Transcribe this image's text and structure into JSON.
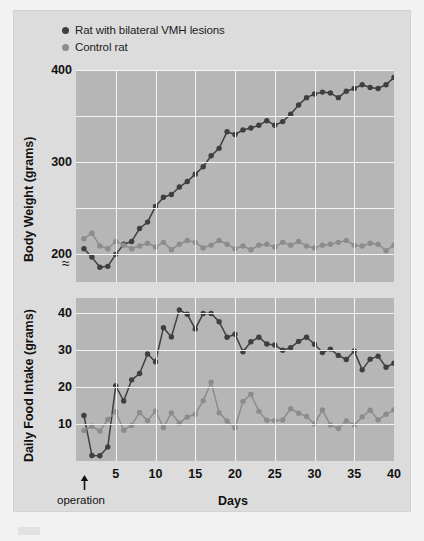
{
  "legend": {
    "items": [
      {
        "label": "Rat with bilateral VMH lesions",
        "color": "#3f3f3f"
      },
      {
        "label": "Control rat",
        "color": "#8c8c8c"
      }
    ]
  },
  "annotations": {
    "operation_label": "operation",
    "axis_break_symbol": "≈"
  },
  "colors": {
    "lesion": "#3f3f3f",
    "control": "#8c8c8c",
    "plot_background": "#b6b6b6",
    "panel_background": "#dcdcdc",
    "page_background": "#f2f2f2",
    "gridline": "#f4f4f4"
  },
  "chart_data": [
    {
      "type": "line",
      "title": "",
      "xlabel": "Days",
      "ylabel": "Body Weight (grams)",
      "xlim": [
        0,
        40
      ],
      "ylim": [
        170,
        400
      ],
      "xticks": [
        5,
        10,
        15,
        20,
        25,
        30,
        35,
        40
      ],
      "yticks": [
        200,
        300,
        400
      ],
      "gridlines_y": [
        200,
        250,
        300,
        350,
        400
      ],
      "gridlines_x": [
        5,
        10,
        15,
        20,
        25,
        30,
        35,
        40
      ],
      "grid": true,
      "legend_position": "above-plot",
      "axis_break": true,
      "x": [
        1,
        2,
        3,
        4,
        5,
        6,
        7,
        8,
        9,
        10,
        11,
        12,
        13,
        14,
        15,
        16,
        17,
        18,
        19,
        20,
        21,
        22,
        23,
        24,
        25,
        26,
        27,
        28,
        29,
        30,
        31,
        32,
        33,
        34,
        35,
        36,
        37,
        38,
        39,
        40
      ],
      "series": [
        {
          "name": "Rat with bilateral VMH lesions",
          "color": "#3f3f3f",
          "values": [
            206,
            197,
            186,
            187,
            200,
            211,
            214,
            228,
            235,
            252,
            262,
            265,
            273,
            279,
            287,
            295,
            307,
            315,
            333,
            330,
            335,
            337,
            340,
            345,
            340,
            344,
            352,
            362,
            370,
            374,
            376,
            375,
            370,
            377,
            380,
            384,
            381,
            380,
            384,
            392
          ]
        },
        {
          "name": "Control rat",
          "color": "#8c8c8c",
          "values": [
            217,
            223,
            209,
            206,
            214,
            210,
            206,
            209,
            212,
            208,
            213,
            205,
            211,
            215,
            213,
            207,
            210,
            215,
            211,
            206,
            209,
            205,
            210,
            211,
            208,
            213,
            210,
            214,
            209,
            207,
            210,
            211,
            213,
            215,
            210,
            209,
            212,
            211,
            204,
            210
          ]
        }
      ]
    },
    {
      "type": "line",
      "title": "",
      "xlabel": "Days",
      "ylabel": "Daily Food Intake (grams)",
      "xlim": [
        0,
        40
      ],
      "ylim": [
        0,
        44
      ],
      "xticks": [
        5,
        10,
        15,
        20,
        25,
        30,
        35,
        40
      ],
      "yticks": [
        10,
        20,
        30,
        40
      ],
      "gridlines_y": [
        10,
        20,
        30,
        40
      ],
      "gridlines_x": [
        5,
        10,
        15,
        20,
        25,
        30,
        35,
        40
      ],
      "grid": true,
      "x": [
        1,
        2,
        3,
        4,
        5,
        6,
        7,
        8,
        9,
        10,
        11,
        12,
        13,
        14,
        15,
        16,
        17,
        18,
        19,
        20,
        21,
        22,
        23,
        24,
        25,
        26,
        27,
        28,
        29,
        30,
        31,
        32,
        33,
        34,
        35,
        36,
        37,
        38,
        39,
        40
      ],
      "series": [
        {
          "name": "Rat with bilateral VMH lesions",
          "color": "#3f3f3f",
          "values": [
            12.3,
            1.5,
            1.4,
            3.8,
            20.3,
            16.2,
            21.9,
            23.6,
            28.9,
            26.8,
            36.0,
            33.5,
            40.8,
            39.6,
            35.6,
            39.8,
            39.8,
            37.6,
            33.4,
            34.2,
            29.5,
            32.2,
            33.4,
            31.6,
            31.3,
            29.9,
            30.6,
            32.3,
            33.4,
            31.5,
            29.3,
            30.2,
            28.5,
            27.4,
            29.7,
            24.6,
            27.5,
            28.3,
            25.3,
            26.4
          ]
        },
        {
          "name": "Control rat",
          "color": "#8c8c8c",
          "values": [
            8.2,
            9.4,
            8.1,
            11.2,
            13.3,
            8.3,
            9.6,
            13.1,
            10.9,
            13.5,
            9.0,
            13.0,
            10.2,
            11.9,
            12.6,
            16.3,
            21.3,
            13.0,
            10.8,
            8.9,
            16.1,
            18.0,
            13.4,
            11.0,
            10.9,
            11.1,
            14.1,
            12.9,
            12.0,
            10.0,
            13.8,
            9.7,
            8.8,
            10.8,
            9.7,
            11.9,
            13.7,
            11.1,
            12.6,
            13.8
          ]
        }
      ]
    }
  ]
}
